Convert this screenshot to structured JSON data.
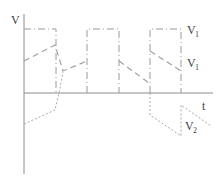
{
  "diagram": {
    "y_axis_label": "V",
    "x_axis_label": "t",
    "curves": [
      {
        "name": "square-wave",
        "label": "V",
        "subscript": "1",
        "style": "dash-dot"
      },
      {
        "name": "v1-wave",
        "label": "V",
        "subscript": "1",
        "style": "dashed"
      },
      {
        "name": "v2-wave",
        "label": "V",
        "subscript": "2",
        "style": "dotted"
      }
    ],
    "colors": {
      "axis": "#8c8c8c",
      "curves": "#a0a0a0",
      "text": "#444444"
    }
  }
}
